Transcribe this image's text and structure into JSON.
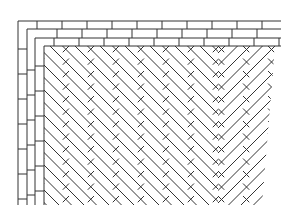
{
  "figure": {
    "colors": {
      "background": "#ffffff",
      "line": "#333333"
    },
    "border": {
      "courses": 3,
      "course_height_px": 8.5,
      "brick_length_px": 25
    },
    "field": {
      "pattern": "herringbone",
      "angle_deg": 45,
      "spacing_px": 12.5
    }
  }
}
